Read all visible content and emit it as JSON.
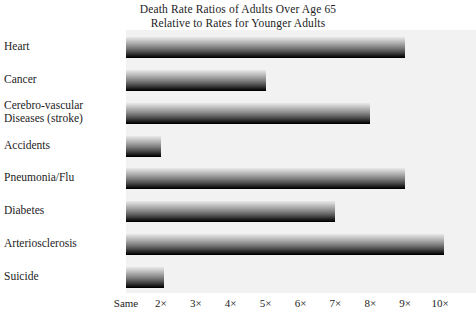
{
  "chart_data": {
    "type": "bar",
    "orientation": "horizontal",
    "title": "Death Rate Ratios of Adults Over Age 65 Relative to Rates for Younger Adults",
    "title_lines": [
      "Death Rate Ratios of Adults Over Age 65",
      "Relative to Rates for Younger Adults"
    ],
    "categories": [
      "Heart",
      "Cancer",
      "Cerebro-vascular\nDiseases (stroke)",
      "Accidents",
      "Pneumonia/Flu",
      "Diabetes",
      "Arteriosclerosis",
      "Suicide"
    ],
    "values": [
      9.0,
      5.0,
      8.0,
      2.0,
      9.0,
      7.0,
      10.1,
      2.1
    ],
    "xlabel": "",
    "ylabel": "",
    "xlim": [
      1,
      11
    ],
    "grid": false,
    "legend": null,
    "tick_values": [
      1,
      2,
      3,
      4,
      5,
      6,
      7,
      8,
      9,
      10
    ],
    "tick_labels": [
      "Same",
      "2×",
      "3×",
      "4×",
      "5×",
      "6×",
      "7×",
      "8×",
      "9×",
      "10×"
    ],
    "colors": {
      "panel_background": "#f2f2f2",
      "page_background": "#ffffff",
      "bar_gradient_top": "#e9e9e9",
      "bar_gradient_bottom": "#0a0a0a",
      "bar_edge": "#000000",
      "text": "#232323"
    }
  }
}
